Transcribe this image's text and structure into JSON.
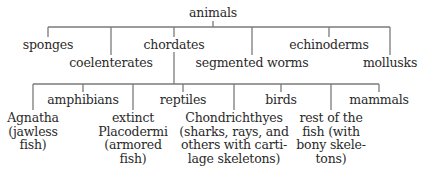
{
  "diagram": {
    "type": "tree",
    "root": {
      "label": "animals",
      "children": [
        {
          "label": "sponges"
        },
        {
          "label": "coelenterates"
        },
        {
          "label": "chordates",
          "children": [
            {
              "label": "Agnatha\n(jawless\nfish)"
            },
            {
              "label": "amphibians"
            },
            {
              "label": "extinct\nPlacodermi\n(armored\nfish)"
            },
            {
              "label": "reptiles"
            },
            {
              "label": "Chondrichthyes\n(sharks, rays, and\nothers with carti-\nlage skeletons)"
            },
            {
              "label": "birds"
            },
            {
              "label": "rest of the\nfish (with\nbony skele-\ntons)"
            },
            {
              "label": "mammals"
            }
          ]
        },
        {
          "label": "segmented worms"
        },
        {
          "label": "echinoderms"
        },
        {
          "label": "mollusks"
        }
      ]
    }
  },
  "colors": {
    "line": "#7a7a7a",
    "text": "#2a2a2a",
    "background": "#ffffff"
  }
}
